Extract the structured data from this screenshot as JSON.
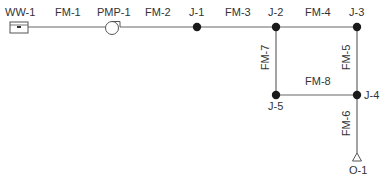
{
  "diagram": {
    "type": "pipe-network",
    "colors": {
      "line": "#666666",
      "node": "#1a1a1a",
      "text": "#333333",
      "background": "#ffffff"
    },
    "nodes": [
      {
        "id": "WW-1",
        "kind": "wet-well",
        "x": 19,
        "y": 27
      },
      {
        "id": "PMP-1",
        "kind": "pump",
        "x": 113,
        "y": 27
      },
      {
        "id": "J-1",
        "kind": "junction",
        "x": 197,
        "y": 27
      },
      {
        "id": "J-2",
        "kind": "junction",
        "x": 276,
        "y": 27
      },
      {
        "id": "J-3",
        "kind": "junction",
        "x": 357,
        "y": 27
      },
      {
        "id": "J-4",
        "kind": "junction",
        "x": 357,
        "y": 95
      },
      {
        "id": "J-5",
        "kind": "junction",
        "x": 276,
        "y": 95
      },
      {
        "id": "O-1",
        "kind": "outlet",
        "x": 357,
        "y": 158
      }
    ],
    "links": [
      {
        "id": "FM-1",
        "from": "WW-1",
        "to": "PMP-1"
      },
      {
        "id": "FM-2",
        "from": "PMP-1",
        "to": "J-1"
      },
      {
        "id": "FM-3",
        "from": "J-1",
        "to": "J-2"
      },
      {
        "id": "FM-4",
        "from": "J-2",
        "to": "J-3"
      },
      {
        "id": "FM-5",
        "from": "J-3",
        "to": "J-4"
      },
      {
        "id": "FM-6",
        "from": "J-4",
        "to": "O-1"
      },
      {
        "id": "FM-7",
        "from": "J-2",
        "to": "J-5"
      },
      {
        "id": "FM-8",
        "from": "J-5",
        "to": "J-4"
      }
    ]
  },
  "labels": {
    "ww1": "WW-1",
    "pmp1": "PMP-1",
    "j1": "J-1",
    "j2": "J-2",
    "j3": "J-3",
    "j4": "J-4",
    "j5": "J-5",
    "o1": "O-1",
    "fm1": "FM-1",
    "fm2": "FM-2",
    "fm3": "FM-3",
    "fm4": "FM-4",
    "fm5": "FM-5",
    "fm6": "FM-6",
    "fm7": "FM-7",
    "fm8": "FM-8"
  }
}
